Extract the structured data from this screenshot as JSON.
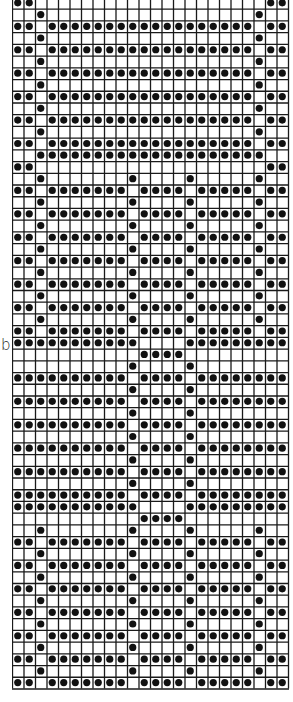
{
  "label": "b",
  "grid": {
    "columns": 24,
    "line_color": "#1a1a1a",
    "dot_color": "#111111",
    "background": "#ffffff",
    "row_types": {
      "A": [
        0,
        1,
        3,
        4,
        5,
        6,
        7,
        8,
        9,
        10,
        11,
        12,
        13,
        14,
        15,
        16,
        17,
        18,
        19,
        20,
        22,
        23
      ],
      "B": [
        2,
        21
      ],
      "C": [
        0,
        1,
        3,
        4,
        5,
        6,
        7,
        8,
        9,
        11,
        12,
        13,
        14,
        16,
        17,
        18,
        19,
        20,
        22,
        23
      ],
      "D": [
        2,
        10,
        15,
        21
      ],
      "E": [
        0,
        1,
        2,
        3,
        4,
        5,
        6,
        7,
        8,
        9,
        11,
        12,
        13,
        14,
        16,
        17,
        18,
        19,
        20,
        21,
        22,
        23
      ],
      "F": [
        10,
        15
      ],
      "G": [
        0,
        1,
        2,
        3,
        4,
        5,
        6,
        7,
        8,
        9,
        10,
        15,
        16,
        17,
        18,
        19,
        20,
        21,
        22,
        23
      ],
      "H": [
        11,
        12,
        13,
        14
      ],
      "I": [
        2,
        3,
        4,
        5,
        6,
        7,
        8,
        9,
        10,
        11,
        12,
        13,
        14,
        15,
        16,
        17,
        18,
        19,
        20,
        21
      ],
      "J": [
        0,
        1,
        22,
        23
      ]
    },
    "rows": [
      "J",
      "B",
      "A",
      "B",
      "A",
      "B",
      "A",
      "B",
      "A",
      "B",
      "A",
      "B",
      "A",
      "I",
      "J",
      "D",
      "C",
      "D",
      "C",
      "D",
      "C",
      "D",
      "C",
      "D",
      "C",
      "D",
      "C",
      "D",
      "C",
      "G",
      "H",
      "F",
      "E",
      "F",
      "E",
      "F",
      "E",
      "F",
      "E",
      "F",
      "E",
      "F",
      "E",
      "G",
      "H",
      "D",
      "C",
      "D",
      "C",
      "D",
      "C",
      "D",
      "C",
      "D",
      "C",
      "D",
      "C",
      "D",
      "C"
    ],
    "label_row_index": 30
  }
}
